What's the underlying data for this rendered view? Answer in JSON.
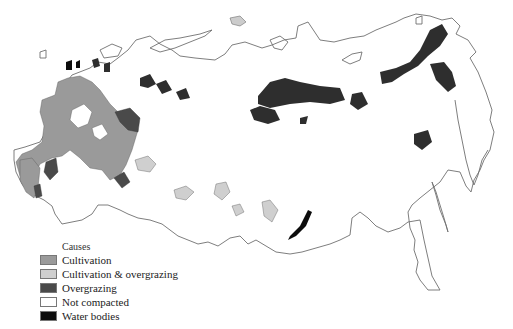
{
  "legend": {
    "title": "Causes",
    "items": [
      {
        "label": "Cultivation",
        "color": "#9a9a9a"
      },
      {
        "label": "Cultivation & overgrazing",
        "color": "#cfcfcf"
      },
      {
        "label": "Overgrazing",
        "color": "#4a4a4a"
      },
      {
        "label": "Not compacted",
        "color": "#ffffff"
      },
      {
        "label": "Water bodies",
        "color": "#0d0d0d"
      }
    ]
  },
  "colors": {
    "outline": "#6f6f6f",
    "cultivation": "#9a9a9a",
    "cultivation_overgrazing": "#cfcfcf",
    "overgrazing": "#2e2e2e",
    "water": "#0d0d0d",
    "background": "#ffffff"
  }
}
